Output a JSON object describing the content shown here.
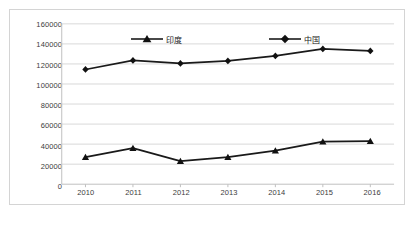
{
  "chart_data": {
    "type": "line",
    "title": "",
    "xlabel": "",
    "ylabel": "",
    "categories": [
      "2010",
      "2011",
      "2012",
      "2013",
      "2014",
      "2015",
      "2016"
    ],
    "ylim": [
      0,
      160000
    ],
    "ytick_labels": [
      "160000",
      "140000",
      "120000",
      "100000",
      "80000",
      "60000",
      "40000",
      "20000",
      "0"
    ],
    "yticks": [
      160000,
      140000,
      120000,
      100000,
      80000,
      60000,
      40000,
      20000,
      0
    ],
    "grid": true,
    "legend_position": "top-center",
    "series": [
      {
        "name": "印度",
        "marker": "triangle",
        "color": "#000000",
        "values": [
          27000,
          36000,
          23000,
          27000,
          33500,
          42500,
          43000
        ]
      },
      {
        "name": "中国",
        "marker": "diamond",
        "color": "#000000",
        "values": [
          114500,
          123500,
          120500,
          123000,
          128000,
          135000,
          133000
        ]
      }
    ]
  },
  "legend": {
    "items": [
      {
        "label": "印度",
        "marker": "triangle"
      },
      {
        "label": "中国",
        "marker": "diamond"
      }
    ]
  },
  "colors": {
    "series_line": "#1a1a1a",
    "gridline": "#d9d9d9",
    "axis": "#bfbfbf",
    "border": "#d4d4d4",
    "tick_text": "#3c3c3c"
  }
}
